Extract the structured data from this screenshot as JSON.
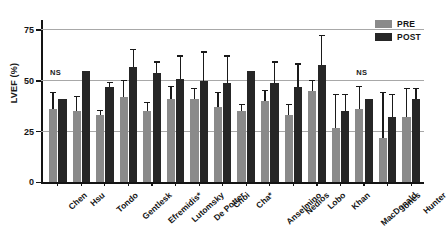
{
  "chart_data": {
    "type": "bar",
    "title": "",
    "subtitle": "",
    "xlabel": "",
    "ylabel": "LVEF (%)",
    "ylim": [
      0,
      80
    ],
    "yticks": [
      0,
      25,
      50,
      75
    ],
    "ytick_labels": [
      "0",
      "25",
      "50",
      "75"
    ],
    "grid": "horizontal gridlines at 25, 50, 75",
    "legend_position": "top-right",
    "categories": [
      "Chen",
      "Hsu",
      "Tondo",
      "Gentlesk",
      "Efremidis*",
      "Lutomsky",
      "De Potter",
      "Choi",
      "Cha*",
      "Anselmino",
      "Nedios",
      "Lobo",
      "Khan",
      "MacDonald",
      "Jones",
      "Hunter"
    ],
    "series": [
      {
        "name": "PRE",
        "color": "#8a8a8a",
        "values": [
          36,
          35,
          33,
          42,
          35,
          41,
          41,
          37,
          35,
          40,
          33,
          45,
          27,
          36,
          22,
          32
        ],
        "err_low": [
          30,
          29,
          31,
          38,
          32,
          36,
          36,
          33,
          32,
          35,
          29,
          40,
          22,
          31,
          17,
          27
        ],
        "err_high": [
          44,
          42,
          35,
          50,
          39,
          47,
          46,
          44,
          38,
          45,
          38,
          50,
          43,
          47,
          44,
          46
        ]
      },
      {
        "name": "POST",
        "color": "#262626",
        "values": [
          41,
          55,
          47,
          57,
          54,
          51,
          50,
          49,
          55,
          49,
          47,
          58,
          35,
          41,
          32,
          41
        ],
        "err_low": [
          41,
          55,
          45,
          50,
          50,
          42,
          40,
          39,
          55,
          41,
          38,
          46,
          29,
          41,
          24,
          35
        ],
        "err_high": [
          41,
          55,
          49,
          65,
          59,
          62,
          64,
          62,
          55,
          59,
          58,
          72,
          43,
          41,
          43,
          46
        ]
      }
    ],
    "annotations": [
      {
        "text": "NS",
        "category": "Chen",
        "y": 52
      },
      {
        "text": "NS",
        "category": "MacDonald",
        "y": 52
      }
    ],
    "legend": [
      {
        "label": "PRE",
        "color": "#8a8a8a"
      },
      {
        "label": "POST",
        "color": "#262626"
      }
    ]
  }
}
